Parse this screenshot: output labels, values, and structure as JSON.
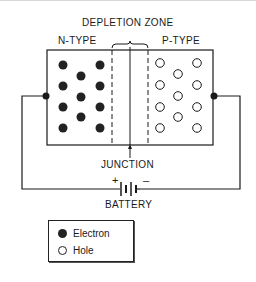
{
  "diagram": {
    "title": "DEPLETION ZONE",
    "left_region_label": "N-TYPE",
    "right_region_label": "P-TYPE",
    "junction_label": "JUNCTION",
    "battery_label": "BATTERY",
    "battery_plus": "+",
    "battery_minus": "–",
    "colors": {
      "ink": "#1a1a1a",
      "electron_fill": "#222222",
      "hole_fill": "#ffffff"
    },
    "electrons": [
      {
        "x": 63,
        "y": 65
      },
      {
        "x": 100,
        "y": 65
      },
      {
        "x": 81,
        "y": 76
      },
      {
        "x": 63,
        "y": 86
      },
      {
        "x": 100,
        "y": 86
      },
      {
        "x": 81,
        "y": 97
      },
      {
        "x": 63,
        "y": 107
      },
      {
        "x": 100,
        "y": 107
      },
      {
        "x": 81,
        "y": 117
      },
      {
        "x": 63,
        "y": 128
      },
      {
        "x": 100,
        "y": 128
      }
    ],
    "holes": [
      {
        "x": 160,
        "y": 63
      },
      {
        "x": 197,
        "y": 63
      },
      {
        "x": 178,
        "y": 74
      },
      {
        "x": 160,
        "y": 85
      },
      {
        "x": 197,
        "y": 85
      },
      {
        "x": 178,
        "y": 96
      },
      {
        "x": 160,
        "y": 107
      },
      {
        "x": 197,
        "y": 107
      },
      {
        "x": 178,
        "y": 117
      },
      {
        "x": 160,
        "y": 128
      },
      {
        "x": 197,
        "y": 128
      }
    ]
  },
  "legend": {
    "items": [
      {
        "symbol": "filled-circle",
        "label": "Electron"
      },
      {
        "symbol": "open-circle",
        "label": "Hole"
      }
    ]
  }
}
